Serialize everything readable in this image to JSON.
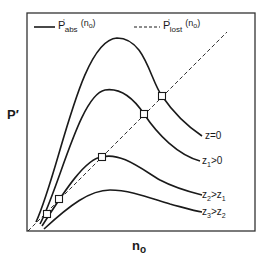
{
  "legend": {
    "solid": {
      "symbol": "P",
      "prime": "'",
      "sub": "abs",
      "arg": "(n",
      "arg_sub": "o",
      "arg_close": ")"
    },
    "dashed": {
      "symbol": "P",
      "prime": "'",
      "sub": "lost",
      "arg": "(n",
      "arg_sub": "o",
      "arg_close": ")"
    }
  },
  "axes": {
    "y_label": "P′",
    "x_label": "n",
    "x_label_sub": "o"
  },
  "curves": [
    {
      "name": "z=0",
      "label": "z=0",
      "label_main": "z=0",
      "label_sub": "",
      "label_rest": ""
    },
    {
      "name": "z1>0",
      "label_main": "z",
      "label_sub": "1",
      "label_rest": ">0"
    },
    {
      "name": "z2>z1",
      "label_main": "z",
      "label_sub": "2",
      "label_rest": ">z",
      "label_sub2": "1"
    },
    {
      "name": "z3>z2",
      "label_main": "z",
      "label_sub": "3",
      "label_rest": ">z",
      "label_sub2": "2"
    }
  ],
  "colors": {
    "ink": "#1a1a1a",
    "frame": "#333333",
    "background": "#ffffff"
  }
}
